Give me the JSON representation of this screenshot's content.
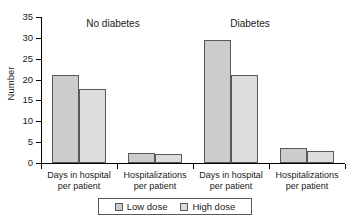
{
  "chart_data": {
    "type": "bar",
    "title": "",
    "xlabel": "",
    "ylabel": "Number",
    "ylim": [
      0,
      35
    ],
    "yticks": [
      0,
      5,
      10,
      15,
      20,
      25,
      30,
      35
    ],
    "grid": false,
    "legend_position": "bottom",
    "categories": [
      "Days in hospital per patient",
      "Hospitalizations per patient",
      "Days in hospital per patient",
      "Hospitalizations per patient"
    ],
    "category_lines": [
      [
        "Days in hospital",
        "per patient"
      ],
      [
        "Hospitalizations",
        "per patient"
      ],
      [
        "Days in hospital",
        "per patient"
      ],
      [
        "Hospitalizations",
        "per patient"
      ]
    ],
    "groups": [
      {
        "label": "No diabetes",
        "categories": [
          0,
          1
        ]
      },
      {
        "label": "Diabetes",
        "categories": [
          2,
          3
        ]
      }
    ],
    "series": [
      {
        "name": "Low dose",
        "color": "#cccccc",
        "values": [
          21.0,
          2.5,
          29.5,
          3.5
        ]
      },
      {
        "name": "High dose",
        "color": "#dddddd",
        "values": [
          17.7,
          2.2,
          21.0,
          2.9
        ]
      }
    ]
  },
  "axis": {
    "y_title": "Number",
    "y_tick_labels": [
      "0",
      "5",
      "10",
      "15",
      "20",
      "25",
      "30",
      "35"
    ]
  },
  "groups": {
    "no_diabetes": "No diabetes",
    "diabetes": "Diabetes"
  },
  "categories": [
    {
      "line1": "Days in hospital",
      "line2": "per patient"
    },
    {
      "line1": "Hospitalizations",
      "line2": "per patient"
    },
    {
      "line1": "Days in hospital",
      "line2": "per patient"
    },
    {
      "line1": "Hospitalizations",
      "line2": "per patient"
    }
  ],
  "legend": {
    "low": "Low dose",
    "high": "High dose"
  },
  "colors": {
    "low_dose": "#cccccc",
    "high_dose": "#dddddd",
    "bar_outline": "#58595b",
    "axis": "#000000"
  }
}
